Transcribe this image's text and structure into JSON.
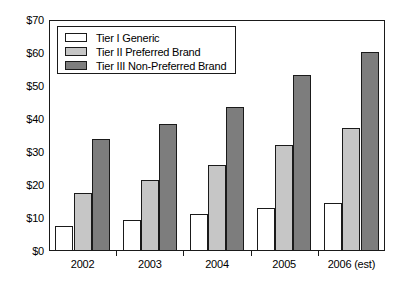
{
  "chart_data": {
    "type": "bar",
    "title": "",
    "subtitle": "",
    "xlabel": "",
    "ylabel": "",
    "categories": [
      "2002",
      "2003",
      "2004",
      "2005",
      "2006 (est)"
    ],
    "series": [
      {
        "name": "Tier I Generic",
        "color": "#ffffff",
        "values": [
          7.6,
          9.5,
          11.2,
          13.1,
          14.4
        ]
      },
      {
        "name": "Tier II Preferred Brand",
        "color": "#c6c6c6",
        "values": [
          17.5,
          21.4,
          26.1,
          32.2,
          37.3
        ]
      },
      {
        "name": "Tier III Non-Preferred Brand",
        "color": "#7d7d7d",
        "values": [
          33.8,
          38.5,
          43.5,
          53.3,
          60.2
        ]
      }
    ],
    "ylim": [
      0,
      70
    ],
    "ytick_values": [
      0,
      10,
      20,
      30,
      40,
      50,
      60,
      70
    ],
    "ytick_labels": [
      "$0",
      "$10",
      "$20",
      "$30",
      "$40",
      "$50",
      "$60",
      "$70"
    ],
    "grid": false,
    "legend_position": "upper-left",
    "legend_entries": [
      "Tier I Generic",
      "Tier II Preferred Brand",
      "Tier III Non-Preferred Brand"
    ]
  },
  "colors": {
    "axis": "#1a1a1a",
    "background": "#ffffff",
    "tier1": "#ffffff",
    "tier2": "#c6c6c6",
    "tier3": "#7d7d7d"
  }
}
